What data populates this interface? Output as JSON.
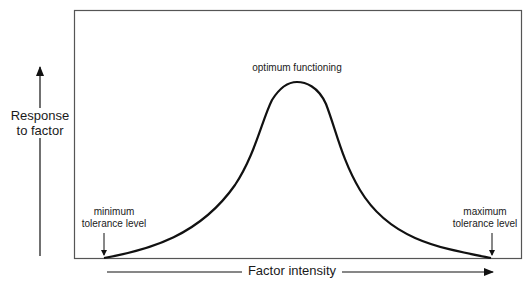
{
  "diagram": {
    "frame": {
      "x": 74,
      "y": 10,
      "width": 447,
      "height": 248,
      "stroke": "#555555"
    },
    "curve": {
      "stroke": "#111111",
      "start": {
        "x": 104,
        "y": 258
      },
      "peak": {
        "x": 297,
        "y": 83
      },
      "end": {
        "x": 491,
        "y": 258
      }
    },
    "labels": {
      "peak": "optimum functioning",
      "min_line1": "minimum",
      "min_line2": "tolerance level",
      "max_line1": "maximum",
      "max_line2": "tolerance level",
      "y_axis_line1": "Response",
      "y_axis_line2": "to factor",
      "x_axis": "Factor intensity"
    }
  }
}
